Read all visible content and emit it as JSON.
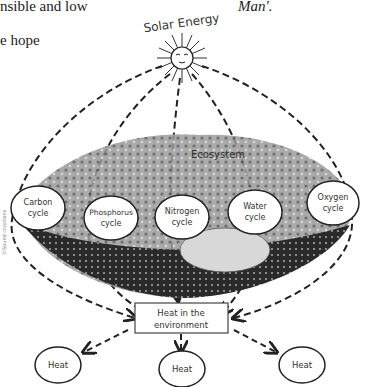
{
  "page_text": {
    "top_left_line1": "nsible and low",
    "top_left_line2": "e hope",
    "top_right": "Man'."
  },
  "diagram": {
    "source_label": "Solar Energy",
    "ecosystem_label": "Ecosystem",
    "cycles": [
      {
        "line1": "Carbon",
        "line2": "cycle"
      },
      {
        "line1": "Phosphorus",
        "line2": "cycle"
      },
      {
        "line1": "Nitrogen",
        "line2": "cycle"
      },
      {
        "line1": "Water",
        "line2": "cycle"
      },
      {
        "line1": "Oxygen",
        "line2": "cycle"
      }
    ],
    "sink_label_line1": "Heat in the",
    "sink_label_line2": "environment",
    "outputs": [
      "Heat",
      "Heat",
      "Heat"
    ],
    "credit": "©Sound creations",
    "colors": {
      "ink": "#222222",
      "shade": "#6a6a6a",
      "soil": "#2a2a2a",
      "water": "#d8d8d8"
    }
  }
}
